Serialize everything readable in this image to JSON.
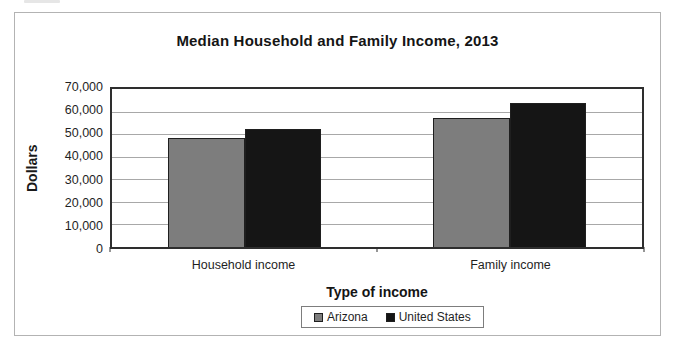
{
  "chart_data": {
    "type": "bar",
    "title": "Median Household and Family Income, 2013",
    "xlabel": "Type of income",
    "ylabel": "Dollars",
    "categories": [
      "Household income",
      "Family income"
    ],
    "series": [
      {
        "name": "Arizona",
        "color": "#7d7d7d",
        "values": [
          48500,
          57000
        ]
      },
      {
        "name": "United States",
        "color": "#151515",
        "values": [
          52500,
          64000
        ]
      }
    ],
    "ylim": [
      0,
      70000
    ],
    "ytick_step": 10000,
    "yticks": [
      "70,000",
      "60,000",
      "50,000",
      "40,000",
      "30,000",
      "20,000",
      "10,000",
      "0"
    ],
    "grid": true,
    "legend_position": "bottom",
    "colors": {
      "plot_border": "#2e2e2e",
      "gridline": "#a8a8a8",
      "frame_border": "#b3b3b3",
      "text": "#1c1c1c"
    }
  }
}
